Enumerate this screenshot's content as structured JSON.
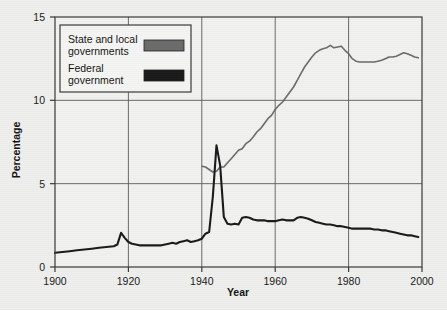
{
  "figure": {
    "background_color": "#eeeeec",
    "plot_background_color": "#f1f1ef",
    "frame_color": "#3a3a3a",
    "grid_color": "#5a5a5a"
  },
  "legend": {
    "position": "top-left-inside",
    "entries": [
      {
        "label_line1": "State and local",
        "label_line2": "governments",
        "color": "#6b6b6b",
        "series_key": "state_and_local"
      },
      {
        "label_line1": "Federal",
        "label_line2": "government",
        "color": "#1a1a1a",
        "series_key": "federal"
      }
    ]
  },
  "chart_data": {
    "type": "line",
    "title": "",
    "xlabel": "Year",
    "ylabel": "Percentage",
    "xlim": [
      1900,
      2000
    ],
    "ylim": [
      0,
      15
    ],
    "xticks": [
      1900,
      1920,
      1940,
      1960,
      1980,
      2000
    ],
    "yticks": [
      0,
      5,
      10,
      15
    ],
    "xtick_labels": [
      "1900",
      "1920",
      "1940",
      "1960",
      "1980",
      "2000"
    ],
    "ytick_labels": [
      "0",
      "5",
      "10",
      "15"
    ],
    "grid": true,
    "grid_axis": "both",
    "legend_position": "upper left",
    "series": [
      {
        "name": "State and local governments",
        "key": "state_and_local",
        "color": "#6b6b6b",
        "line_width": 1.6,
        "x": [
          1940,
          1941,
          1942,
          1943,
          1944,
          1945,
          1946,
          1947,
          1948,
          1949,
          1950,
          1951,
          1952,
          1953,
          1954,
          1955,
          1956,
          1957,
          1958,
          1959,
          1960,
          1961,
          1962,
          1963,
          1964,
          1965,
          1966,
          1967,
          1968,
          1969,
          1970,
          1971,
          1972,
          1973,
          1974,
          1975,
          1976,
          1977,
          1978,
          1979,
          1980,
          1981,
          1982,
          1983,
          1984,
          1985,
          1986,
          1987,
          1988,
          1989,
          1990,
          1991,
          1992,
          1993,
          1994,
          1995,
          1996,
          1997,
          1998,
          1999
        ],
        "y": [
          6.05,
          6.0,
          5.85,
          5.7,
          5.75,
          6.0,
          6.0,
          6.25,
          6.5,
          6.75,
          7.0,
          7.1,
          7.4,
          7.55,
          7.8,
          8.1,
          8.3,
          8.6,
          8.9,
          9.1,
          9.45,
          9.7,
          9.9,
          10.2,
          10.5,
          10.8,
          11.2,
          11.6,
          12.0,
          12.3,
          12.6,
          12.85,
          13.0,
          13.1,
          13.15,
          13.3,
          13.15,
          13.2,
          13.25,
          13.0,
          12.8,
          12.5,
          12.35,
          12.3,
          12.3,
          12.3,
          12.3,
          12.3,
          12.35,
          12.4,
          12.5,
          12.6,
          12.6,
          12.65,
          12.75,
          12.85,
          12.8,
          12.7,
          12.6,
          12.55
        ]
      },
      {
        "name": "Federal government",
        "key": "federal",
        "color": "#1a1a1a",
        "line_width": 2.1,
        "x": [
          1900,
          1902,
          1904,
          1906,
          1908,
          1910,
          1912,
          1914,
          1916,
          1917,
          1918,
          1919,
          1920,
          1921,
          1922,
          1923,
          1924,
          1925,
          1926,
          1927,
          1928,
          1929,
          1930,
          1931,
          1932,
          1933,
          1934,
          1935,
          1936,
          1937,
          1938,
          1939,
          1940,
          1941,
          1942,
          1943,
          1944,
          1945,
          1946,
          1947,
          1948,
          1949,
          1950,
          1951,
          1952,
          1953,
          1954,
          1955,
          1956,
          1957,
          1958,
          1959,
          1960,
          1961,
          1962,
          1963,
          1964,
          1965,
          1966,
          1967,
          1968,
          1969,
          1970,
          1971,
          1972,
          1973,
          1974,
          1975,
          1976,
          1977,
          1978,
          1979,
          1980,
          1981,
          1982,
          1983,
          1984,
          1985,
          1986,
          1987,
          1988,
          1989,
          1990,
          1991,
          1992,
          1993,
          1994,
          1995,
          1996,
          1997,
          1998,
          1999
        ],
        "y": [
          0.85,
          0.9,
          0.95,
          1.0,
          1.05,
          1.1,
          1.15,
          1.2,
          1.25,
          1.35,
          2.05,
          1.75,
          1.5,
          1.4,
          1.35,
          1.3,
          1.3,
          1.3,
          1.3,
          1.3,
          1.3,
          1.3,
          1.35,
          1.4,
          1.45,
          1.4,
          1.5,
          1.55,
          1.6,
          1.5,
          1.55,
          1.6,
          1.7,
          2.0,
          2.1,
          4.2,
          7.3,
          6.1,
          3.0,
          2.6,
          2.55,
          2.6,
          2.55,
          2.95,
          3.0,
          2.95,
          2.85,
          2.8,
          2.8,
          2.8,
          2.75,
          2.75,
          2.75,
          2.8,
          2.85,
          2.8,
          2.8,
          2.8,
          2.95,
          3.0,
          2.95,
          2.9,
          2.8,
          2.7,
          2.65,
          2.6,
          2.55,
          2.55,
          2.5,
          2.45,
          2.45,
          2.4,
          2.35,
          2.3,
          2.3,
          2.3,
          2.3,
          2.3,
          2.3,
          2.25,
          2.25,
          2.2,
          2.2,
          2.15,
          2.1,
          2.05,
          2.0,
          1.95,
          1.9,
          1.9,
          1.85,
          1.8
        ]
      }
    ],
    "annotations": []
  }
}
